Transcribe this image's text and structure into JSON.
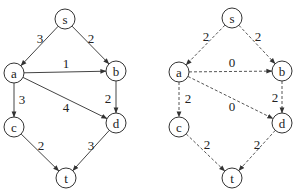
{
  "graphs": [
    {
      "name": "capacity-graph",
      "style": "solid",
      "nodes": {
        "s": {
          "label": "s",
          "x": 65,
          "y": 19
        },
        "a": {
          "label": "a",
          "x": 14,
          "y": 73
        },
        "b": {
          "label": "b",
          "x": 116,
          "y": 71
        },
        "c": {
          "label": "c",
          "x": 14,
          "y": 127
        },
        "d": {
          "label": "d",
          "x": 116,
          "y": 123
        },
        "t": {
          "label": "t",
          "x": 66,
          "y": 178
        }
      },
      "edges": [
        {
          "from": "s",
          "to": "a",
          "label": "3",
          "lx": 40,
          "ly": 38
        },
        {
          "from": "s",
          "to": "b",
          "label": "2",
          "lx": 91,
          "ly": 38
        },
        {
          "from": "a",
          "to": "b",
          "label": "1",
          "lx": 66,
          "ly": 63
        },
        {
          "from": "a",
          "to": "c",
          "label": "3",
          "lx": 22,
          "ly": 99
        },
        {
          "from": "a",
          "to": "d",
          "label": "4",
          "lx": 66,
          "ly": 107
        },
        {
          "from": "b",
          "to": "d",
          "label": "2",
          "lx": 108,
          "ly": 98
        },
        {
          "from": "c",
          "to": "t",
          "label": "2",
          "lx": 41,
          "ly": 145
        },
        {
          "from": "d",
          "to": "t",
          "label": "3",
          "lx": 91,
          "ly": 145
        }
      ]
    },
    {
      "name": "flow-graph",
      "style": "dashed",
      "nodes": {
        "s": {
          "label": "s",
          "x": 232,
          "y": 18
        },
        "a": {
          "label": "a",
          "x": 179,
          "y": 72
        },
        "b": {
          "label": "b",
          "x": 282,
          "y": 71
        },
        "c": {
          "label": "c",
          "x": 179,
          "y": 127
        },
        "d": {
          "label": "d",
          "x": 282,
          "y": 123
        },
        "t": {
          "label": "t",
          "x": 232,
          "y": 178
        }
      },
      "edges": [
        {
          "from": "s",
          "to": "a",
          "label": "2",
          "lx": 206,
          "ly": 36
        },
        {
          "from": "s",
          "to": "b",
          "label": "2",
          "lx": 258,
          "ly": 36
        },
        {
          "from": "a",
          "to": "b",
          "label": "0",
          "lx": 232,
          "ly": 62
        },
        {
          "from": "a",
          "to": "c",
          "label": "2",
          "lx": 188,
          "ly": 98
        },
        {
          "from": "a",
          "to": "d",
          "label": "0",
          "lx": 232,
          "ly": 106
        },
        {
          "from": "b",
          "to": "d",
          "label": "2",
          "lx": 275,
          "ly": 97
        },
        {
          "from": "c",
          "to": "t",
          "label": "2",
          "lx": 207,
          "ly": 144
        },
        {
          "from": "d",
          "to": "t",
          "label": "2",
          "lx": 257,
          "ly": 144
        }
      ]
    }
  ]
}
